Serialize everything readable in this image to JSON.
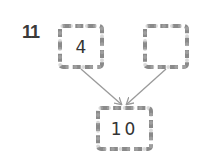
{
  "question": {
    "number": "11"
  },
  "number_bond": {
    "left_part": "4",
    "right_part": "",
    "whole": "10"
  },
  "colors": {
    "box_border": "#8a8a8a",
    "arrow": "#9a9a9a",
    "text": "#333333"
  }
}
